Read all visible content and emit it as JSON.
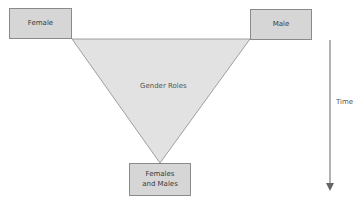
{
  "diagram": {
    "nodes": {
      "female": "Female",
      "male": "Male",
      "combined": "Females and Males"
    },
    "triangle_label": "Gender Roles",
    "axis_label": "Time",
    "colors": {
      "box_fill": "#d6d6d6",
      "triangle_fill": "#e2e2e2",
      "stroke": "#8a8a8a",
      "arrow": "#666666"
    }
  }
}
